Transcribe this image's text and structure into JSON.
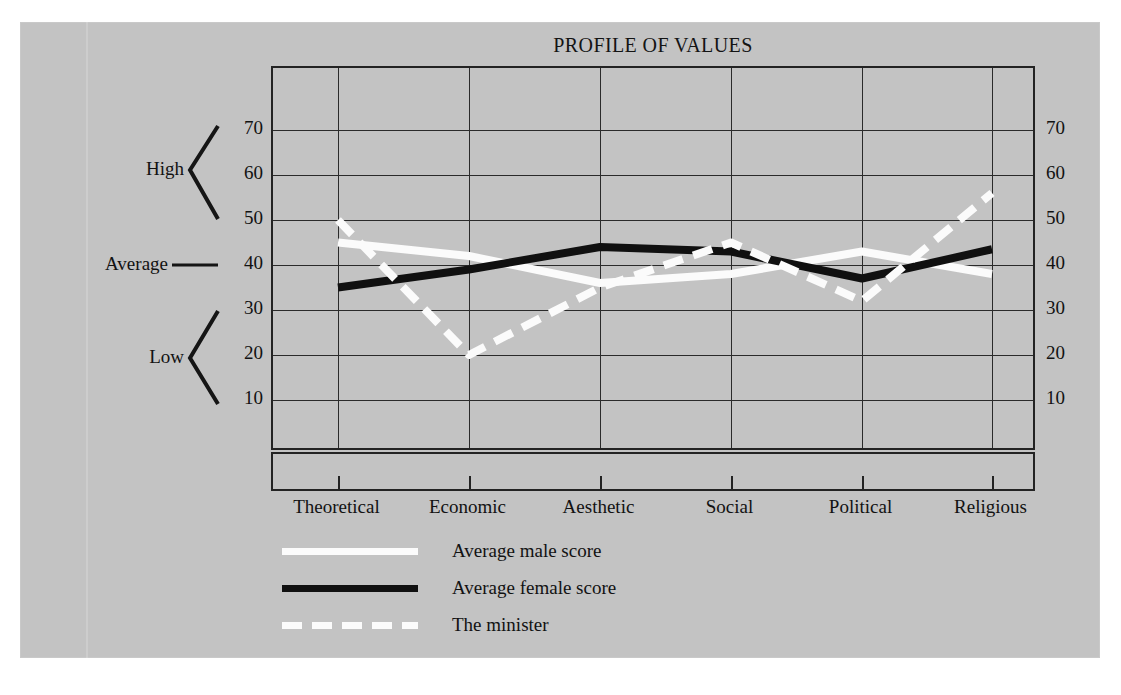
{
  "figure": {
    "background_color": "#c3c3c3",
    "page_color": "#ffffff"
  },
  "chart_data": {
    "type": "line",
    "title": "PROFILE OF VALUES",
    "xlabel": "",
    "ylabel": "",
    "categories": [
      "Theoretical",
      "Economic",
      "Aesthetic",
      "Social",
      "Political",
      "Religious"
    ],
    "ylim": [
      0,
      75
    ],
    "yticks": [
      10,
      20,
      30,
      40,
      50,
      60,
      70
    ],
    "left_axis_ticks": [
      "70",
      "60",
      "50",
      "40",
      "30",
      "20",
      "10"
    ],
    "right_axis_ticks": [
      "70",
      "60",
      "50",
      "40",
      "30",
      "20",
      "10"
    ],
    "grid": true,
    "legend_position": "below",
    "series": [
      {
        "name": "Average male score",
        "color": "#fbfbfb",
        "style": "solid",
        "values": [
          45,
          42,
          36,
          38,
          43,
          38
        ]
      },
      {
        "name": "Average female score",
        "color": "#101010",
        "style": "solid",
        "values": [
          35,
          39,
          44,
          43,
          37,
          43.5
        ]
      },
      {
        "name": "The minister",
        "color": "#fbfbfb",
        "style": "dashed",
        "values": [
          50,
          20,
          35,
          45,
          32,
          56
        ]
      }
    ],
    "annotations": [
      {
        "label": "High",
        "span": [
          50,
          70
        ],
        "kind": "bracket"
      },
      {
        "label": "Average",
        "span": [
          40,
          40
        ],
        "kind": "pointer"
      },
      {
        "label": "Low",
        "span": [
          10,
          30
        ],
        "kind": "bracket"
      }
    ]
  },
  "legend": {
    "items": [
      {
        "label": "Average male score",
        "swatch": "solid-white"
      },
      {
        "label": "Average female score",
        "swatch": "solid-black"
      },
      {
        "label": "The minister",
        "swatch": "dashed-white"
      }
    ]
  }
}
